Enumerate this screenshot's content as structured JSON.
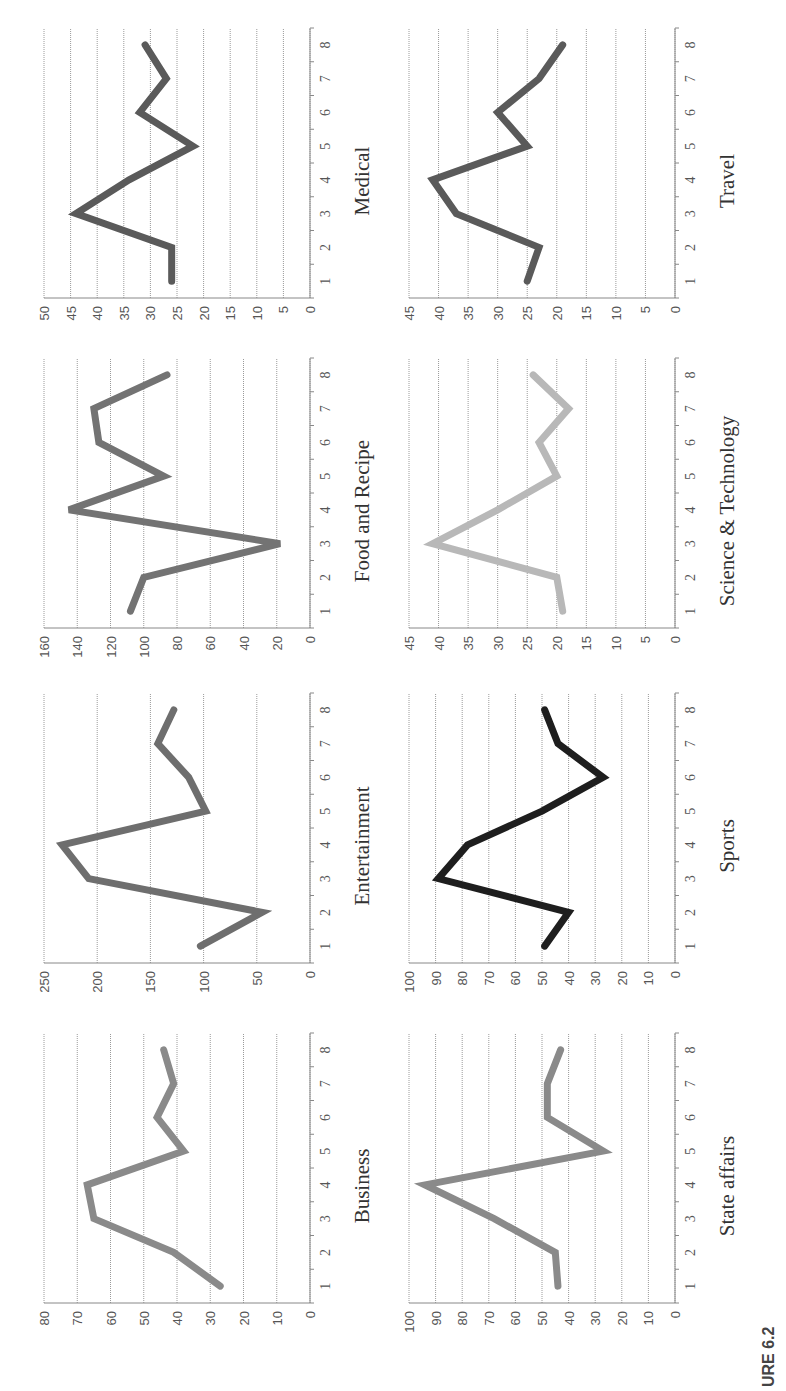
{
  "figure": {
    "caption": "URE 6.2"
  },
  "chart_data": [
    {
      "type": "line",
      "title": "Business",
      "x": [
        1,
        2,
        3,
        4,
        5,
        6,
        7,
        8
      ],
      "values": [
        27,
        41,
        65,
        67,
        38,
        46,
        41,
        44
      ],
      "ylim": [
        0,
        80
      ],
      "yticks": [
        0,
        10,
        20,
        30,
        40,
        50,
        60,
        70,
        80
      ],
      "color": "#8a8a8a",
      "grid": true,
      "xlabel": "",
      "ylabel": ""
    },
    {
      "type": "line",
      "title": "Entertainment",
      "x": [
        1,
        2,
        3,
        4,
        5,
        6,
        7,
        8
      ],
      "values": [
        103,
        45,
        208,
        233,
        98,
        114,
        143,
        128
      ],
      "ylim": [
        0,
        250
      ],
      "yticks": [
        0,
        50,
        100,
        150,
        200,
        250
      ],
      "color": "#6e6e6e",
      "grid": true,
      "xlabel": "",
      "ylabel": ""
    },
    {
      "type": "line",
      "title": "Food and Recipe",
      "x": [
        1,
        2,
        3,
        4,
        5,
        6,
        7,
        8
      ],
      "values": [
        108,
        100,
        18,
        145,
        88,
        127,
        130,
        86
      ],
      "ylim": [
        0,
        160
      ],
      "yticks": [
        0,
        20,
        40,
        60,
        80,
        100,
        120,
        140,
        160
      ],
      "color": "#737373",
      "grid": true,
      "xlabel": "",
      "ylabel": ""
    },
    {
      "type": "line",
      "title": "Medical",
      "x": [
        1,
        2,
        3,
        4,
        5,
        6,
        7,
        8
      ],
      "values": [
        26,
        26,
        44,
        34,
        22,
        32,
        27,
        31
      ],
      "ylim": [
        0,
        50
      ],
      "yticks": [
        0,
        5,
        10,
        15,
        20,
        25,
        30,
        35,
        40,
        45,
        50
      ],
      "color": "#5a5a5a",
      "grid": true,
      "xlabel": "",
      "ylabel": ""
    },
    {
      "type": "line",
      "title": "State affairs",
      "x": [
        1,
        2,
        3,
        4,
        5,
        6,
        7,
        8
      ],
      "values": [
        44,
        45,
        68,
        94,
        27,
        48,
        48,
        43
      ],
      "ylim": [
        0,
        100
      ],
      "yticks": [
        0,
        10,
        20,
        30,
        40,
        50,
        60,
        70,
        80,
        90,
        100
      ],
      "color": "#8a8a8a",
      "grid": true,
      "xlabel": "",
      "ylabel": ""
    },
    {
      "type": "line",
      "title": "Sports",
      "x": [
        1,
        2,
        3,
        4,
        5,
        6,
        7,
        8
      ],
      "values": [
        49,
        40,
        89,
        78,
        50,
        27,
        44,
        49
      ],
      "ylim": [
        0,
        100
      ],
      "yticks": [
        0,
        10,
        20,
        30,
        40,
        50,
        60,
        70,
        80,
        90,
        100
      ],
      "color": "#1e1e1e",
      "grid": true,
      "xlabel": "",
      "ylabel": ""
    },
    {
      "type": "line",
      "title": "Science & Technology",
      "x": [
        1,
        2,
        3,
        4,
        5,
        6,
        7,
        8
      ],
      "values": [
        19,
        20,
        41,
        30,
        20,
        23,
        18,
        24
      ],
      "ylim": [
        0,
        45
      ],
      "yticks": [
        0,
        5,
        10,
        15,
        20,
        25,
        30,
        35,
        40,
        45
      ],
      "color": "#b8b8b8",
      "grid": true,
      "xlabel": "",
      "ylabel": ""
    },
    {
      "type": "line",
      "title": "Travel",
      "x": [
        1,
        2,
        3,
        4,
        5,
        6,
        7,
        8
      ],
      "values": [
        25,
        23,
        37,
        41,
        25,
        30,
        23,
        19
      ],
      "ylim": [
        0,
        45
      ],
      "yticks": [
        0,
        5,
        10,
        15,
        20,
        25,
        30,
        35,
        40,
        45
      ],
      "color": "#5a5a5a",
      "grid": true,
      "xlabel": "",
      "ylabel": ""
    }
  ]
}
